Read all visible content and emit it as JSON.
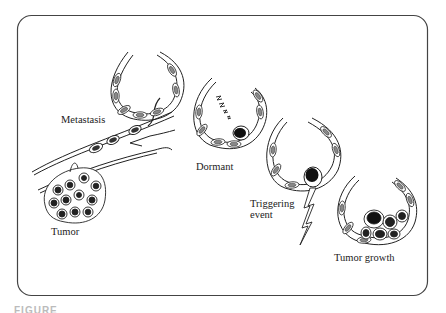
{
  "diagram": {
    "stages": [
      {
        "id": "tumor",
        "label": "Tumor"
      },
      {
        "id": "metastasis",
        "label": "Metastasis"
      },
      {
        "id": "dormant",
        "label": "Dormant"
      },
      {
        "id": "triggering",
        "label": "Triggering event",
        "line1": "Triggering",
        "line2": "event"
      },
      {
        "id": "growth",
        "label": "Tumor growth"
      }
    ],
    "colors": {
      "stroke": "#222222",
      "frame": "#444444",
      "cell_fill": "#9a9a9a",
      "nucleus": "#1e1e1e",
      "background": "#ffffff"
    }
  },
  "caption_fragment": "FIGURE"
}
